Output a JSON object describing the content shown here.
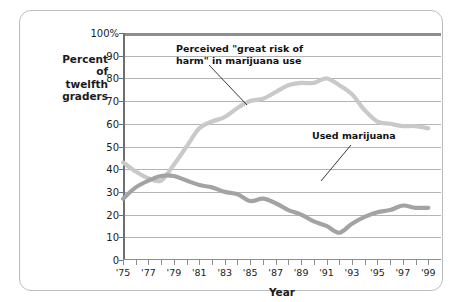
{
  "axes": {
    "ylabel_lines": [
      "Percent",
      "of",
      "twelfth",
      "graders"
    ],
    "xlabel": "Year",
    "yticks": [
      "100%",
      "90",
      "80",
      "70",
      "60",
      "50",
      "40",
      "30",
      "20",
      "10",
      "0"
    ],
    "xticks": [
      "'75",
      "'77",
      "'79",
      "'81",
      "'83",
      "'85",
      "'87",
      "'89",
      "'91",
      "'93",
      "'95",
      "'97",
      "'99"
    ]
  },
  "annotations": {
    "risk": "Perceived \"great risk of\nharm\" in marijuana use",
    "use": "Used marijuana"
  },
  "colors": {
    "risk_line": "#c9c9c9",
    "use_line": "#a3a3a3",
    "grid": "#b4b4b4",
    "axis": "#8e8e8e",
    "frame": "#b9bdc1",
    "text": "#1b1b1b"
  },
  "chart_data": {
    "type": "line",
    "title": "",
    "xlabel": "Year",
    "ylabel": "Percent of twelfth graders",
    "xlim": [
      1975,
      2000
    ],
    "ylim": [
      0,
      100
    ],
    "grid": true,
    "legend": "annotations-inline",
    "x": [
      1975,
      1976,
      1977,
      1978,
      1979,
      1980,
      1981,
      1982,
      1983,
      1984,
      1985,
      1986,
      1987,
      1988,
      1989,
      1990,
      1991,
      1992,
      1993,
      1994,
      1995,
      1996,
      1997,
      1998,
      1999
    ],
    "series": [
      {
        "name": "Perceived \"great risk of harm\" in marijuana use",
        "color": "#c9c9c9",
        "values": [
          43,
          39,
          36,
          35,
          42,
          50,
          58,
          61,
          63,
          67,
          70,
          71,
          74,
          77,
          78,
          78,
          80,
          77,
          73,
          66,
          61,
          60,
          59,
          59,
          58
        ]
      },
      {
        "name": "Used marijuana",
        "color": "#a3a3a3",
        "values": [
          27,
          32,
          35,
          37,
          37,
          35,
          33,
          32,
          30,
          29,
          26,
          27,
          25,
          22,
          20,
          17,
          15,
          12,
          16,
          19,
          21,
          22,
          24,
          23,
          23
        ]
      }
    ]
  }
}
